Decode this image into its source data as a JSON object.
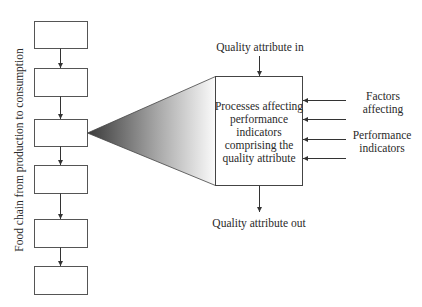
{
  "diagram": {
    "chain_label": "Food chain from production to consumption",
    "chain_box_count": 6,
    "central_box": {
      "lines": [
        "Processes affecting",
        "performance",
        "indicators",
        "comprising the",
        "quality attribute"
      ]
    },
    "input_label": "Quality attribute in",
    "output_label": "Quality attribute out",
    "side_labels": {
      "factors": [
        "Factors",
        "affecting"
      ],
      "performance": [
        "Performance",
        "indicators"
      ]
    },
    "colors": {
      "gradient_dark": "#3a3a3a",
      "gradient_light": "#fbfbfb",
      "stroke": "#555555"
    }
  }
}
